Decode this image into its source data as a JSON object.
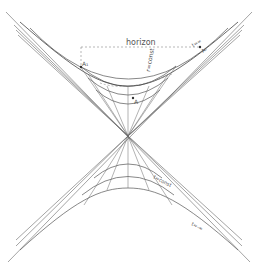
{
  "diagram": {
    "type": "spacetime-diagram",
    "labels": {
      "horizon": "horizon",
      "r_const": "r=const",
      "t_inf": "t=∞",
      "a1": "A₁",
      "a2": "A₂",
      "a": "A",
      "t_const": "t=const",
      "t_minus_inf": "t=-∞"
    },
    "colors": {
      "line": "#555555",
      "dashed": "#888888",
      "text": "#555555"
    }
  }
}
